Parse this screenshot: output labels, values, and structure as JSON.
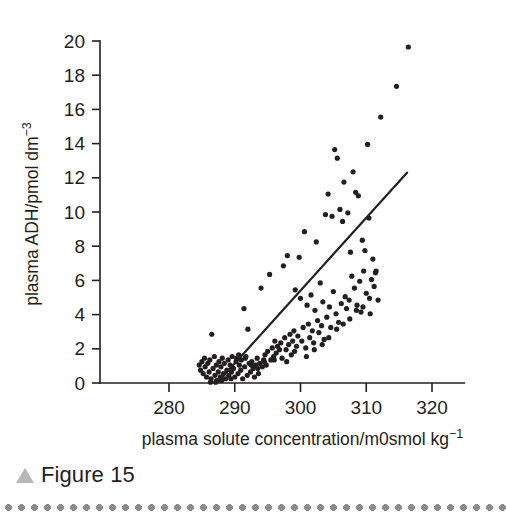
{
  "figure": {
    "caption_label": "Figure 15",
    "caption_marker_icon": "triangle-up-icon",
    "marker_color": "#b7b7b7",
    "rule_color": "#8b8b8b",
    "ink_color": "#231f20",
    "background_color": "#ffffff"
  },
  "chart_data": {
    "type": "scatter",
    "title": "",
    "xlabel": "plasma solute concentration/m0smol kg",
    "xlabel_exponent": "−1",
    "ylabel": "plasma ADH/pmol dm",
    "ylabel_exponent": "−3",
    "xlim": [
      272,
      324
    ],
    "ylim": [
      0,
      20
    ],
    "xticks": [
      280,
      290,
      300,
      310,
      320
    ],
    "yticks": [
      0,
      2,
      4,
      6,
      8,
      10,
      12,
      14,
      16,
      18,
      20
    ],
    "xtick_labels": [
      "280",
      "290",
      "300",
      "310",
      "320"
    ],
    "ytick_labels": [
      "0",
      "2",
      "4",
      "6",
      "8",
      "10",
      "12",
      "14",
      "16",
      "18",
      "20"
    ],
    "grid": false,
    "legend": false,
    "point_color": "#231f20",
    "point_radius_px": 2.6,
    "fit_line": {
      "label": "regression line",
      "color": "#231f20",
      "x_start": 287.3,
      "y_start": 0.0,
      "x_end": 316.2,
      "y_end": 12.3
    },
    "series": [
      {
        "name": "plasma ADH vs plasma solute concentration",
        "points": [
          [
            284.6,
            1.05
          ],
          [
            284.8,
            0.75
          ],
          [
            285.0,
            1.25
          ],
          [
            285.2,
            0.55
          ],
          [
            285.4,
            1.45
          ],
          [
            285.5,
            0.95
          ],
          [
            285.7,
            0.35
          ],
          [
            285.9,
            1.15
          ],
          [
            286.1,
            0.65
          ],
          [
            286.2,
            1.35
          ],
          [
            286.4,
            0.25
          ],
          [
            286.5,
            2.85
          ],
          [
            286.7,
            0.85
          ],
          [
            286.9,
            1.55
          ],
          [
            287.0,
            0.45
          ],
          [
            287.2,
            1.05
          ],
          [
            287.3,
            0.15
          ],
          [
            287.5,
            0.65
          ],
          [
            287.6,
            1.25
          ],
          [
            287.8,
            0.35
          ],
          [
            287.9,
            0.95
          ],
          [
            288.1,
            1.45
          ],
          [
            288.3,
            0.55
          ],
          [
            288.4,
            1.15
          ],
          [
            288.6,
            0.25
          ],
          [
            288.8,
            0.75
          ],
          [
            289.0,
            1.35
          ],
          [
            289.1,
            0.45
          ],
          [
            289.3,
            1.05
          ],
          [
            289.5,
            0.65
          ],
          [
            289.6,
            1.55
          ],
          [
            289.8,
            0.85
          ],
          [
            290.0,
            0.35
          ],
          [
            290.2,
            1.25
          ],
          [
            290.3,
            1.45
          ],
          [
            290.5,
            0.55
          ],
          [
            290.7,
            1.05
          ],
          [
            290.9,
            0.75
          ],
          [
            291.0,
            1.35
          ],
          [
            291.2,
            0.25
          ],
          [
            291.4,
            4.35
          ],
          [
            291.5,
            0.95
          ],
          [
            291.7,
            1.55
          ],
          [
            291.9,
            0.45
          ],
          [
            292.0,
            3.15
          ],
          [
            292.2,
            1.15
          ],
          [
            292.4,
            0.65
          ],
          [
            292.6,
            1.25
          ],
          [
            292.8,
            0.85
          ],
          [
            293.0,
            0.35
          ],
          [
            293.2,
            1.05
          ],
          [
            293.4,
            1.45
          ],
          [
            293.6,
            0.55
          ],
          [
            293.8,
            1.15
          ],
          [
            294.0,
            5.55
          ],
          [
            294.2,
            0.95
          ],
          [
            294.4,
            1.35
          ],
          [
            294.6,
            1.65
          ],
          [
            294.8,
            1.05
          ],
          [
            295.0,
            1.85
          ],
          [
            295.3,
            6.35
          ],
          [
            295.5,
            1.35
          ],
          [
            295.7,
            2.05
          ],
          [
            295.9,
            1.55
          ],
          [
            296.1,
            2.45
          ],
          [
            296.3,
            1.75
          ],
          [
            296.5,
            2.15
          ],
          [
            296.8,
            1.95
          ],
          [
            297.0,
            2.35
          ],
          [
            297.2,
            1.45
          ],
          [
            297.4,
            6.85
          ],
          [
            297.6,
            2.65
          ],
          [
            297.8,
            1.95
          ],
          [
            298.0,
            7.45
          ],
          [
            298.2,
            2.25
          ],
          [
            298.4,
            2.85
          ],
          [
            298.6,
            1.65
          ],
          [
            298.8,
            2.45
          ],
          [
            299.0,
            3.05
          ],
          [
            299.2,
            5.45
          ],
          [
            299.4,
            2.15
          ],
          [
            299.6,
            2.75
          ],
          [
            299.8,
            7.35
          ],
          [
            300.0,
            4.95
          ],
          [
            300.2,
            2.45
          ],
          [
            300.4,
            3.25
          ],
          [
            300.6,
            8.85
          ],
          [
            300.8,
            2.05
          ],
          [
            301.0,
            4.55
          ],
          [
            301.2,
            3.45
          ],
          [
            301.4,
            2.65
          ],
          [
            301.6,
            5.15
          ],
          [
            301.8,
            3.05
          ],
          [
            302.0,
            2.35
          ],
          [
            302.2,
            4.25
          ],
          [
            302.4,
            8.25
          ],
          [
            302.6,
            3.65
          ],
          [
            302.8,
            2.95
          ],
          [
            303.0,
            5.85
          ],
          [
            303.2,
            3.35
          ],
          [
            303.4,
            4.75
          ],
          [
            303.6,
            2.55
          ],
          [
            303.8,
            9.85
          ],
          [
            304.0,
            3.85
          ],
          [
            304.2,
            11.05
          ],
          [
            304.4,
            4.45
          ],
          [
            304.6,
            3.25
          ],
          [
            304.8,
            9.75
          ],
          [
            305.0,
            5.35
          ],
          [
            305.2,
            13.65
          ],
          [
            305.4,
            4.05
          ],
          [
            305.6,
            13.15
          ],
          [
            305.8,
            3.55
          ],
          [
            306.0,
            10.15
          ],
          [
            306.2,
            4.65
          ],
          [
            306.4,
            9.45
          ],
          [
            306.6,
            11.75
          ],
          [
            306.8,
            5.05
          ],
          [
            307.0,
            4.35
          ],
          [
            307.2,
            9.95
          ],
          [
            307.4,
            4.85
          ],
          [
            307.6,
            7.65
          ],
          [
            307.8,
            6.25
          ],
          [
            308.0,
            12.35
          ],
          [
            308.2,
            5.55
          ],
          [
            308.4,
            11.15
          ],
          [
            308.6,
            4.55
          ],
          [
            308.8,
            10.95
          ],
          [
            309.0,
            5.95
          ],
          [
            309.2,
            4.15
          ],
          [
            309.4,
            8.35
          ],
          [
            309.6,
            6.55
          ],
          [
            309.8,
            7.75
          ],
          [
            310.0,
            5.25
          ],
          [
            310.2,
            13.95
          ],
          [
            310.4,
            9.65
          ],
          [
            310.6,
            4.05
          ],
          [
            310.8,
            6.05
          ],
          [
            311.0,
            7.25
          ],
          [
            311.2,
            5.65
          ],
          [
            311.4,
            6.45
          ],
          [
            311.8,
            4.85
          ],
          [
            312.2,
            15.55
          ],
          [
            314.6,
            17.35
          ],
          [
            316.4,
            19.65
          ],
          [
            286.3,
            0.05
          ],
          [
            287.1,
            0.05
          ],
          [
            288.0,
            0.15
          ],
          [
            289.4,
            0.25
          ],
          [
            290.6,
            1.65
          ],
          [
            291.6,
            1.45
          ],
          [
            292.5,
            1.05
          ],
          [
            293.5,
            0.85
          ],
          [
            294.5,
            1.25
          ],
          [
            296.0,
            1.35
          ],
          [
            297.9,
            1.25
          ],
          [
            299.1,
            1.85
          ],
          [
            300.9,
            1.55
          ],
          [
            302.1,
            1.95
          ],
          [
            303.3,
            2.25
          ],
          [
            304.3,
            2.65
          ],
          [
            305.5,
            3.15
          ],
          [
            306.5,
            3.45
          ],
          [
            307.5,
            3.75
          ],
          [
            308.5,
            4.25
          ],
          [
            309.5,
            4.45
          ],
          [
            310.5,
            4.95
          ],
          [
            311.5,
            6.55
          ]
        ]
      }
    ]
  }
}
